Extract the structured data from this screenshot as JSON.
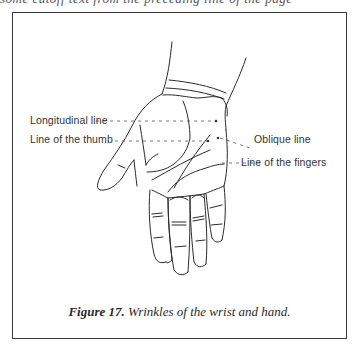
{
  "page": {
    "cut_off_text": "some cutoff text from the preceding line of the page"
  },
  "figure": {
    "labels": {
      "longitudinal": "Longitudinal line",
      "thumb": "Line of the thumb",
      "oblique": "Oblique line",
      "fingers": "Line of the fingers"
    },
    "caption": {
      "number": "Figure 17.",
      "text": " Wrinkles of the wrist and hand."
    }
  }
}
